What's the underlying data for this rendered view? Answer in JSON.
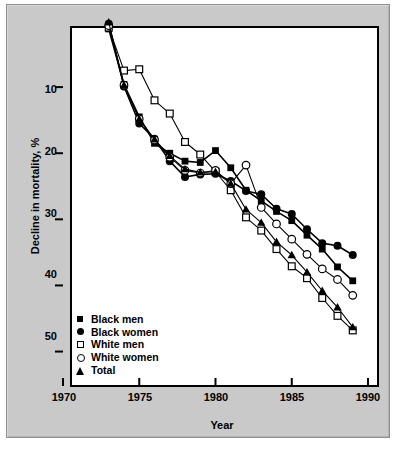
{
  "figure": {
    "background_color": "#c9c9c9",
    "plot_background_color": "#ffffff",
    "frame_color": "#000000"
  },
  "axes": {
    "y_label": "Decline in mortality, %",
    "x_label": "Year",
    "y_ticks": [
      "10",
      "20",
      "30",
      "40",
      "50"
    ],
    "x_ticks": [
      "1970",
      "1975",
      "1980",
      "1985",
      "1990"
    ]
  },
  "legend": {
    "items": [
      {
        "label": "Black men",
        "marker": "filled-square-icon",
        "color": "#000000"
      },
      {
        "label": "Black women",
        "marker": "filled-circle-icon",
        "color": "#000000"
      },
      {
        "label": "White men",
        "marker": "open-square-icon",
        "color": "#000000"
      },
      {
        "label": "White women",
        "marker": "open-circle-icon",
        "color": "#000000"
      },
      {
        "label": "Total",
        "marker": "filled-triangle-icon",
        "color": "#000000"
      }
    ]
  },
  "chart_data": {
    "type": "line",
    "title": "",
    "xlabel": "Year",
    "ylabel": "Decline in mortality, %",
    "xlim": [
      1970,
      1990
    ],
    "ylim": [
      0,
      54
    ],
    "y_inverted": true,
    "grid": false,
    "legend_position": "lower-left-inside",
    "x": [
      1973,
      1974,
      1975,
      1976,
      1977,
      1978,
      1979,
      1980,
      1981,
      1982,
      1983,
      1984,
      1985,
      1986,
      1987,
      1988,
      1989
    ],
    "series": [
      {
        "name": "Black men",
        "marker": "filled-square",
        "values": [
          1.2,
          9.6,
          14.5,
          18.5,
          20.0,
          21.2,
          21.4,
          19.6,
          22.2,
          25.6,
          27.2,
          28.8,
          30.2,
          32.4,
          34.5,
          37.2,
          39.3
        ]
      },
      {
        "name": "Black women",
        "marker": "filled-circle",
        "values": [
          0.4,
          9.9,
          15.5,
          17.8,
          21.2,
          23.6,
          23.2,
          23.1,
          24.2,
          25.7,
          26.2,
          28.4,
          29.2,
          31.5,
          33.6,
          34.0,
          35.4
        ]
      },
      {
        "name": "White men",
        "marker": "open-square",
        "values": [
          1.0,
          7.5,
          7.3,
          12.0,
          14.0,
          18.3,
          20.2,
          22.8,
          25.6,
          29.7,
          31.7,
          34.5,
          37.1,
          38.9,
          41.9,
          44.6,
          46.8
        ]
      },
      {
        "name": "White women",
        "marker": "open-circle",
        "values": [
          0.7,
          9.7,
          14.8,
          18.0,
          20.6,
          22.6,
          23.0,
          22.6,
          24.6,
          21.8,
          28.2,
          30.7,
          33.0,
          35.3,
          37.5,
          39.1,
          41.5
        ]
      },
      {
        "name": "Total",
        "marker": "filled-triangle",
        "values": [
          0.2,
          9.7,
          14.8,
          17.9,
          20.4,
          22.4,
          22.9,
          22.8,
          24.6,
          28.5,
          30.5,
          33.4,
          35.4,
          38.0,
          40.8,
          43.3,
          46.3
        ]
      }
    ]
  }
}
